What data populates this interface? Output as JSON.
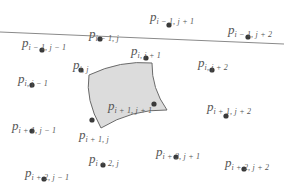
{
  "diagram": {
    "title": "",
    "colors": {
      "background": "#ffffff",
      "point": "#3a3a3a",
      "label": "#555555",
      "line": "#8a8a8a",
      "patch_fill": "#dcdcdc",
      "patch_stroke": "#6a6a6a"
    },
    "line": {
      "x1": 0,
      "y1": 32,
      "x2": 284,
      "y2": 44
    },
    "patch": {
      "label_point": "p_{i+1,j+1}",
      "corners": [
        [
          89,
          75
        ],
        [
          152,
          63
        ],
        [
          167,
          110
        ],
        [
          101,
          128
        ]
      ]
    },
    "points": [
      {
        "id": "p-im1-j",
        "base": "p",
        "sub": "i − 1, j",
        "dot": [
          100,
          39
        ],
        "label": [
          89,
          25
        ]
      },
      {
        "id": "p-im1-jp1",
        "base": "p",
        "sub": "i − 1, j + 1",
        "dot": [
          169,
          25
        ],
        "label": [
          150,
          8
        ]
      },
      {
        "id": "p-im1-jm1",
        "base": "p",
        "sub": "i − 1, j − 1",
        "dot": [
          42,
          50
        ],
        "label": [
          22,
          34
        ]
      },
      {
        "id": "p-im1-jp2",
        "base": "p",
        "sub": "i − 1, j + 2",
        "dot": [
          248,
          37
        ],
        "label": [
          228,
          21
        ]
      },
      {
        "id": "p-i-j",
        "base": "p",
        "sub": "i, j",
        "dot": [
          81,
          70
        ],
        "label": [
          73,
          56
        ]
      },
      {
        "id": "p-i-jp1",
        "base": "p",
        "sub": "i, j + 1",
        "dot": [
          146,
          58
        ],
        "label": [
          131,
          42
        ]
      },
      {
        "id": "p-i-jp2",
        "base": "p",
        "sub": "i, j + 2",
        "dot": [
          212,
          70
        ],
        "label": [
          198,
          54
        ]
      },
      {
        "id": "p-i-jm1",
        "base": "p",
        "sub": "i, j − 1",
        "dot": [
          32,
          85
        ],
        "label": [
          18,
          70
        ]
      },
      {
        "id": "p-ip1-jp1",
        "base": "p",
        "sub": "i + 1, j + 1",
        "dot": [
          154,
          104
        ],
        "label": [
          108,
          97
        ]
      },
      {
        "id": "p-ip1-j",
        "base": "p",
        "sub": "i + 1, j",
        "dot": [
          92,
          120
        ],
        "label": [
          79,
          126
        ]
      },
      {
        "id": "p-ip1-jm1",
        "base": "p",
        "sub": "i + 1, j − 1",
        "dot": [
          32,
          131
        ],
        "label": [
          12,
          117
        ]
      },
      {
        "id": "p-ip1-jp2",
        "base": "p",
        "sub": "i + 1, j + 2",
        "dot": [
          226,
          116
        ],
        "label": [
          207,
          98
        ]
      },
      {
        "id": "p-ip2-j",
        "base": "p",
        "sub": "i + 2, j",
        "dot": [
          103,
          165
        ],
        "label": [
          89,
          150
        ]
      },
      {
        "id": "p-ip2-jp1",
        "base": "p",
        "sub": "i + 2, j + 1",
        "dot": [
          176,
          157
        ],
        "label": [
          156,
          143
        ]
      },
      {
        "id": "p-ip2-jp2",
        "base": "p",
        "sub": "i + 2, j + 2",
        "dot": [
          244,
          169
        ],
        "label": [
          225,
          154
        ]
      },
      {
        "id": "p-ip2-jm1",
        "base": "p",
        "sub": "i + 2, j − 1",
        "dot": [
          44,
          179
        ],
        "label": [
          25,
          164
        ]
      }
    ]
  }
}
